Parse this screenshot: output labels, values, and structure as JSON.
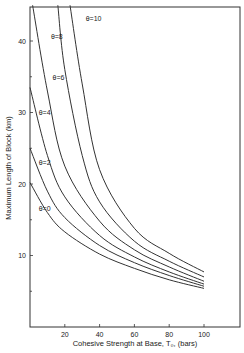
{
  "chart_data": {
    "type": "line",
    "title": "",
    "xlabel": "Cohesive Strength at Base, T0, (bars)",
    "ylabel": "Maximum Length of Block (km)",
    "xlim": [
      0,
      120
    ],
    "ylim": [
      0,
      45
    ],
    "xticks": [
      20,
      40,
      60,
      80,
      100
    ],
    "yticks": [
      10,
      20,
      30,
      40
    ],
    "yminor_ticks": [
      5,
      15,
      25,
      35
    ],
    "grid": false,
    "legend": "inline labels on curves",
    "series": [
      {
        "name": "θ=0",
        "x": [
          0,
          10,
          20,
          40,
          60,
          80,
          100
        ],
        "y": [
          20.2,
          16,
          13.3,
          10.2,
          8.2,
          6.6,
          5.4
        ]
      },
      {
        "name": "θ=2",
        "x": [
          0,
          10,
          20,
          40,
          60,
          80,
          100
        ],
        "y": [
          25,
          19,
          15.3,
          11.4,
          9,
          7.2,
          5.7
        ]
      },
      {
        "name": "θ=4",
        "x": [
          0,
          10,
          20,
          40,
          60,
          80,
          100
        ],
        "y": [
          33.5,
          24,
          18.2,
          12.8,
          9.8,
          7.7,
          6.0
        ]
      },
      {
        "name": "θ=6",
        "x": [
          1.5,
          10,
          20,
          40,
          60,
          80,
          100
        ],
        "y": [
          45,
          33,
          22.5,
          14.8,
          10.8,
          8.4,
          6.4
        ]
      },
      {
        "name": "θ=8",
        "x": [
          16,
          20,
          30,
          40,
          60,
          80,
          100
        ],
        "y": [
          45,
          36,
          24,
          17.5,
          12,
          9.2,
          7.0
        ]
      },
      {
        "name": "θ=10",
        "x": [
          23,
          30,
          40,
          60,
          80,
          100
        ],
        "y": [
          45,
          34,
          22,
          13.8,
          10.3,
          7.7
        ]
      }
    ],
    "curve_labels": [
      {
        "text": "θ=0",
        "x": 5,
        "y": 16.2
      },
      {
        "text": "θ=2",
        "x": 5,
        "y": 22.7
      },
      {
        "text": "θ=4",
        "x": 5,
        "y": 29.6
      },
      {
        "text": "θ=6",
        "x": 13,
        "y": 34.6
      },
      {
        "text": "θ=8",
        "x": 12,
        "y": 40.3
      },
      {
        "text": "θ=10",
        "x": 32,
        "y": 42.8
      }
    ]
  },
  "labels": {
    "xlabel": "Cohesive Strength at Base, T₀, (bars)",
    "ylabel": "Maximum Length of Block  (km)"
  }
}
